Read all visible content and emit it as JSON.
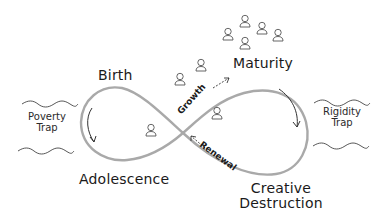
{
  "diagram": {
    "type": "lifecycle-infinity-loop",
    "colors": {
      "loop": "#a9a9a9",
      "ink": "#1a1a1a",
      "background": "#ffffff"
    },
    "stages": {
      "birth": "Birth",
      "maturity": "Maturity",
      "adolescence": "Adolescence",
      "creative_destruction_line1": "Creative",
      "creative_destruction_line2": "Destruction"
    },
    "traps": {
      "poverty_line1": "Poverty",
      "poverty_line2": "Trap",
      "rigidity_line1": "Rigidity",
      "rigidity_line2": "Trap"
    },
    "transitions": {
      "growth": "Growth",
      "renewal": "Renewal"
    },
    "people_counts": {
      "adolescence_loop": 1,
      "growth_path": 2,
      "maturity_cluster": 6,
      "right_loop": 1
    }
  }
}
